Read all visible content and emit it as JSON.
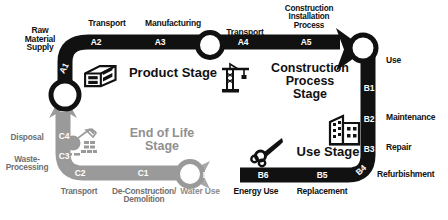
{
  "diagram": {
    "colors": {
      "black": "#111111",
      "gray": "#9a9a9a",
      "mid_gray": "#6f6f6f",
      "white": "#ffffff"
    },
    "stages": [
      {
        "id": "product-stage",
        "name": "Product Stage",
        "color": "#111111",
        "icon": "bricks-icon",
        "modules": [
          {
            "code": "A1",
            "label": "Raw\nMaterial\nSupply"
          },
          {
            "code": "A2",
            "label": "Transport"
          },
          {
            "code": "A3",
            "label": "Manufacturing"
          }
        ]
      },
      {
        "id": "construction-process-stage",
        "name": "Construction Process\nStage",
        "color": "#111111",
        "icon": "crane-icon",
        "modules": [
          {
            "code": "A4",
            "label": "Transport"
          },
          {
            "code": "A5",
            "label": "Construction\nInstallation\nProcess"
          }
        ]
      },
      {
        "id": "use-stage",
        "name": "Use Stage",
        "color": "#111111",
        "icon": "wrench-gears-icon",
        "secondary_icon": "building-icon",
        "modules": [
          {
            "code": "B1",
            "label": "Use"
          },
          {
            "code": "B2",
            "label": "Maintenance"
          },
          {
            "code": "B3",
            "label": "Repair"
          },
          {
            "code": "B4",
            "label": "Refurbishment"
          },
          {
            "code": "B5",
            "label": "Replacement"
          },
          {
            "code": "B6",
            "label": "Energy Use"
          },
          {
            "code": "B7",
            "label": "Water Use"
          }
        ]
      },
      {
        "id": "end-of-life-stage",
        "name": "End of Life\nStage",
        "color": "#9a9a9a",
        "icon": "wrecking-ball-icon",
        "modules": [
          {
            "code": "C1",
            "label": "De-Construction/\nDemolition"
          },
          {
            "code": "C2",
            "label": "Transport"
          },
          {
            "code": "C3",
            "label": "Waste-\nProcessing"
          },
          {
            "code": "C4",
            "label": "Disposal"
          }
        ]
      }
    ]
  }
}
